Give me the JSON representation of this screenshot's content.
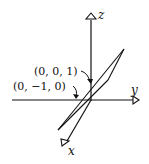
{
  "diagram": {
    "type": "3d-coordinate-plane",
    "axes": {
      "z": {
        "label": "z"
      },
      "y": {
        "label": "y"
      },
      "x": {
        "label": "x"
      }
    },
    "points": [
      {
        "label": "(0, 0, 1)"
      },
      {
        "label": "(0, −1, 0)"
      }
    ],
    "colors": {
      "stroke": "#111111",
      "background": "#ffffff"
    }
  }
}
